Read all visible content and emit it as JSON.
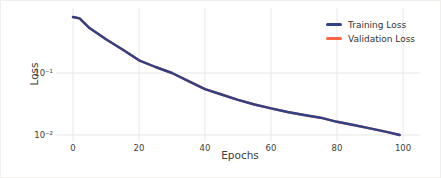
{
  "figure": {
    "background": "#ffffff",
    "grid_color": "#e7e7e7",
    "text_color": "#3d3d3d"
  },
  "chart_data": {
    "type": "line",
    "title": "",
    "xlabel": "Epochs",
    "ylabel": "Loss",
    "yscale": "log",
    "grid": true,
    "legend_position": "upper right",
    "xlim": [
      -5,
      105
    ],
    "ylim": [
      0.008,
      1.1
    ],
    "x_ticks": [
      0,
      20,
      40,
      60,
      80,
      100
    ],
    "y_ticks": [
      {
        "value": 0.1,
        "label": "10⁻¹"
      },
      {
        "value": 0.01,
        "label": "10⁻²"
      }
    ],
    "x": [
      0,
      2,
      5,
      10,
      15,
      20,
      25,
      30,
      35,
      40,
      45,
      50,
      55,
      60,
      65,
      70,
      75,
      80,
      85,
      90,
      95,
      99
    ],
    "series": [
      {
        "name": "Validation Loss",
        "color": "#ff6347",
        "values": [
          0.8,
          0.76,
          0.53,
          0.35,
          0.24,
          0.16,
          0.125,
          0.1,
          0.074,
          0.055,
          0.045,
          0.037,
          0.031,
          0.027,
          0.0235,
          0.021,
          0.019,
          0.0163,
          0.0145,
          0.0128,
          0.0112,
          0.01
        ]
      },
      {
        "name": "Training Loss",
        "color": "#2f4285",
        "values": [
          0.8,
          0.76,
          0.53,
          0.35,
          0.24,
          0.16,
          0.125,
          0.1,
          0.074,
          0.055,
          0.045,
          0.037,
          0.031,
          0.027,
          0.0235,
          0.021,
          0.019,
          0.0163,
          0.0145,
          0.0128,
          0.0112,
          0.01
        ]
      }
    ],
    "legend_order": [
      "Training Loss",
      "Validation Loss"
    ]
  },
  "legend": {
    "items": [
      {
        "label": "Training Loss",
        "color": "#2f4285"
      },
      {
        "label": "Validation Loss",
        "color": "#ff6347"
      }
    ]
  }
}
